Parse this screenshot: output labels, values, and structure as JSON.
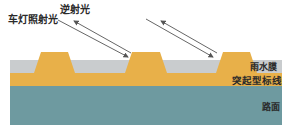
{
  "labels": {
    "headlight": "车灯照射光",
    "retroreflected": "逆射光",
    "water_film": "雨水膜",
    "raised_marking": "突起型标线",
    "road_surface": "路面"
  },
  "colors": {
    "water_film": "#c9ccce",
    "marking": "#e8b049",
    "road": "#6e9aa0",
    "arrow": "#555555"
  },
  "layers": [
    {
      "name": "water_film",
      "top": 60,
      "bottom": 73
    },
    {
      "name": "raised_marking",
      "top": 73,
      "bottom": 86
    },
    {
      "name": "road_surface",
      "top": 86,
      "bottom": 125
    }
  ],
  "bumps": [
    {
      "x_bottom_left": 34,
      "x_top_left": 41,
      "x_top_right": 68,
      "x_bottom_right": 75,
      "top": 52
    },
    {
      "x_bottom_left": 125,
      "x_top_left": 132,
      "x_top_right": 160,
      "x_bottom_right": 167,
      "top": 52
    },
    {
      "x_bottom_left": 216,
      "x_top_left": 223,
      "x_top_right": 250,
      "x_bottom_right": 257,
      "top": 52
    }
  ]
}
